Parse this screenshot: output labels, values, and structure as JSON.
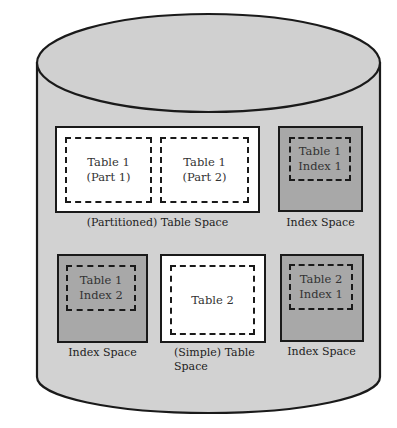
{
  "diagram": {
    "container": "database-cylinder",
    "colors": {
      "cylinder": "#d2d2d2",
      "outline": "#1a1a1a",
      "table_space": "#ffffff",
      "index_space": "#a8a8a8"
    },
    "partitioned": {
      "label": "(Partitioned) Table Space",
      "parts": [
        {
          "line1": "Table 1",
          "line2": "(Part 1)"
        },
        {
          "line1": "Table 1",
          "line2": "(Part 2)"
        }
      ]
    },
    "index_top_right": {
      "label": "Index Space",
      "line1": "Table 1",
      "line2": "Index 1"
    },
    "index_bottom_left": {
      "label": "Index Space",
      "line1": "Table 1",
      "line2": "Index 2"
    },
    "simple": {
      "label_line1": "(Simple) Table",
      "label_line2": "Space",
      "line1": "Table 2"
    },
    "index_bottom_right": {
      "label": "Index Space",
      "line1": "Table 2",
      "line2": "Index 1"
    }
  }
}
